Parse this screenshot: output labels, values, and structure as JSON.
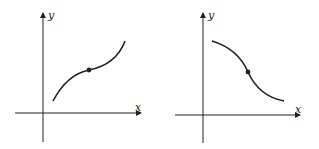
{
  "figures": [
    {
      "id": "increasing",
      "x_label": "x",
      "y_label": "y",
      "description": "increasing curve, concave down then concave up, inflection point marked"
    },
    {
      "id": "decreasing",
      "x_label": "x",
      "y_label": "y",
      "description": "decreasing curve, concave down then concave up, inflection point marked"
    }
  ],
  "colors": {
    "ink": "#222222",
    "background": "#ffffff"
  }
}
